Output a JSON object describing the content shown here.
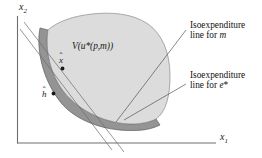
{
  "figure": {
    "domain": "economics-microeconomics-diagram",
    "background_color": "#ffffff",
    "width": 262,
    "height": 158
  },
  "axes": {
    "y_label_base": "x",
    "y_label_sub": "2",
    "x_label_base": "x",
    "x_label_sub": "1",
    "line_color": "#6e6e6e"
  },
  "regions": {
    "upper_contour_set": {
      "label_base": "V(u",
      "label_star": "*",
      "label_args": "(p,m))",
      "fill_color": "#dcdcdc",
      "stroke_color": "#808080"
    },
    "dark_band": {
      "name": "expenditure-band",
      "fill_color": "#8f8f8f",
      "stroke_color": "#5a5a5a"
    }
  },
  "points": [
    {
      "id": "x-hat",
      "label_base": "x",
      "label_accent": "ˆ",
      "dot_color": "#1a1a1a"
    },
    {
      "id": "h-hat",
      "label_base": "h",
      "label_accent": "ˆ",
      "dot_color": "#1a1a1a"
    }
  ],
  "callouts": [
    {
      "id": "isoexpenditure-m",
      "line1": "Isoexpenditure",
      "line2_prefix": "line for ",
      "line2_em": "m",
      "line2_sup": ""
    },
    {
      "id": "isoexpenditure-e-star",
      "line1": "Isoexpenditure",
      "line2_prefix": "line for ",
      "line2_em": "e",
      "line2_sup": "*"
    }
  ],
  "isoexpenditure_lines": {
    "color": "#6b6b6b",
    "count": 2
  },
  "leader_lines": {
    "color": "#555555"
  }
}
